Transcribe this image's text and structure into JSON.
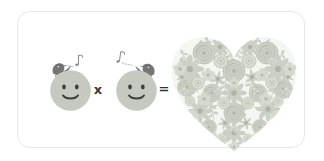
{
  "scene": {
    "description": "Greeting-card style illustration: two smiling circular faces with singing birds multiplied together equal a heart made of flowers",
    "background_color": "#ffffff"
  },
  "card": {
    "border_color": "#e7e7e7",
    "fill_color": "#ffffff",
    "corner_radius": 13
  },
  "equation": {
    "operator_multiply": "x",
    "operator_equals": "=",
    "operator_color": "#3a3a3a",
    "terms": [
      {
        "name": "smiley-face-left",
        "label": "smiling face with singing bird",
        "face_color": "#c6c9c0",
        "feature_color": "#3c3c3c",
        "bird_color": "#6e6e6e",
        "bird_facing": "right",
        "note_glyph": "music-note"
      },
      {
        "name": "smiley-face-right",
        "label": "smiling face with singing bird",
        "face_color": "#c6c9c0",
        "feature_color": "#3c3c3c",
        "bird_color": "#6e6e6e",
        "bird_facing": "left",
        "note_glyph": "music-note"
      },
      {
        "name": "floral-heart",
        "label": "heart made of flowers",
        "flower_color": "#cdd2c8",
        "flower_color_light": "#dfe3da",
        "leaf_color": "#d6dacf"
      }
    ]
  }
}
